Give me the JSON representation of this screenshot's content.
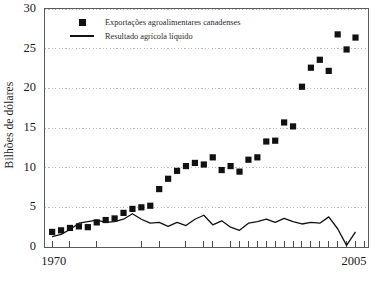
{
  "chart_data": {
    "type": "scatter",
    "title": "",
    "xlabel": "",
    "ylabel": "Bilhões de dólares",
    "xlim": [
      1969.2,
      2005.4
    ],
    "ylim": [
      0,
      30
    ],
    "grid": true,
    "grid_style": "dotted",
    "legend_position": "top-left-inside",
    "y_ticks": [
      0,
      5,
      10,
      15,
      20,
      25,
      30
    ],
    "y_tick_labels": [
      "0",
      "5",
      "10",
      "15",
      "20",
      "25",
      "30"
    ],
    "x_tick_labels_shown": [
      "1970",
      "2005"
    ],
    "x_ticks": [
      1970,
      1972,
      1975,
      1980,
      1982,
      1985,
      1987,
      1988,
      1990,
      1991,
      1992,
      1993,
      1994,
      1995,
      1996,
      1997,
      1998,
      1999,
      2000,
      2001,
      2002,
      2003,
      2004,
      2005
    ],
    "series": [
      {
        "name": "Exportações agroalimentares canadenses",
        "marker": "square",
        "color": "#111111",
        "x": [
          1970,
          1971,
          1972,
          1973,
          1974,
          1975,
          1976,
          1977,
          1978,
          1979,
          1980,
          1981,
          1982,
          1983,
          1984,
          1985,
          1986,
          1987,
          1988,
          1989,
          1990,
          1991,
          1992,
          1993,
          1994,
          1995,
          1996,
          1997,
          1998,
          1999,
          2000,
          2001,
          2002,
          2003,
          2004
        ],
        "values": [
          1.9,
          2.1,
          2.4,
          2.6,
          2.5,
          3.1,
          3.4,
          3.6,
          4.3,
          4.8,
          5.0,
          5.2,
          7.3,
          8.6,
          9.6,
          10.2,
          10.6,
          10.4,
          11.3,
          9.7,
          10.2,
          9.5,
          11.0,
          11.3,
          13.3,
          13.4,
          15.7,
          15.2,
          20.2,
          22.6,
          23.6,
          22.2,
          26.8,
          24.9,
          26.4
        ]
      },
      {
        "name": "Resultado agrícola líquido",
        "marker": "line",
        "color": "#111111",
        "x": [
          1970,
          1971,
          1972,
          1973,
          1974,
          1975,
          1976,
          1977,
          1978,
          1979,
          1980,
          1981,
          1982,
          1983,
          1984,
          1985,
          1986,
          1987,
          1988,
          1989,
          1990,
          1991,
          1992,
          1993,
          1994,
          1995,
          1996,
          1997,
          1998,
          1999,
          2000,
          2001,
          2002,
          2003,
          2004
        ],
        "values": [
          1.3,
          1.6,
          2.2,
          3.0,
          3.2,
          3.4,
          3.1,
          3.2,
          3.5,
          4.2,
          3.5,
          3.0,
          3.1,
          2.6,
          3.1,
          2.7,
          3.5,
          4.0,
          2.8,
          3.3,
          2.5,
          2.1,
          3.0,
          3.2,
          3.5,
          3.1,
          3.6,
          3.2,
          2.9,
          3.1,
          3.0,
          3.8,
          2.3,
          0.2,
          1.9
        ]
      }
    ]
  },
  "legend": {
    "entries": [
      {
        "label": "Exportações agroalimentares canadenses",
        "key": "square"
      },
      {
        "label": "Resultado agrícola líquido",
        "key": "line"
      }
    ]
  },
  "axes": {
    "y_title": "Bilhões de dólares",
    "y_labels": [
      "30",
      "25",
      "20",
      "15",
      "10",
      "5",
      "0"
    ],
    "x_label_left": "1970",
    "x_label_right": "2005"
  }
}
